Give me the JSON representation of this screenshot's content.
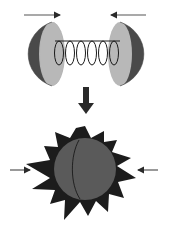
{
  "diagram": {
    "colors": {
      "background": "#ffffff",
      "hemisphere_outer": "#4a4a4a",
      "hemisphere_inner": "#b4b4b4",
      "spring": "#1a1a1a",
      "arrow": "#2a2a2a",
      "sphere": "#5a5a5a",
      "burst": "#1c1c1c",
      "seam": "#1a1a1a"
    },
    "top_stage": {
      "left_arrow": {
        "direction": "right",
        "x1": 24,
        "x2": 62,
        "y": 15
      },
      "right_arrow": {
        "direction": "left",
        "x1": 146,
        "x2": 109,
        "y": 15
      },
      "left_hemisphere": {
        "cx": 52,
        "cy": 52,
        "r": 36,
        "facing": "right"
      },
      "right_hemisphere": {
        "cx": 120,
        "cy": 52,
        "r": 36,
        "facing": "left"
      },
      "spring": {
        "x_start": 54,
        "x_end": 120,
        "y": 52,
        "coils": 6
      }
    },
    "transition_arrow": {
      "direction": "down",
      "x": 86,
      "y1": 87,
      "y2": 114
    },
    "bottom_stage": {
      "sphere": {
        "cx": 85,
        "cy": 169,
        "r": 32
      },
      "burst_spikes": 14,
      "left_arrow": {
        "direction": "right",
        "x1": 10,
        "x2": 32,
        "y": 170
      },
      "right_arrow": {
        "direction": "left",
        "x1": 158,
        "x2": 136,
        "y": 170
      }
    }
  }
}
